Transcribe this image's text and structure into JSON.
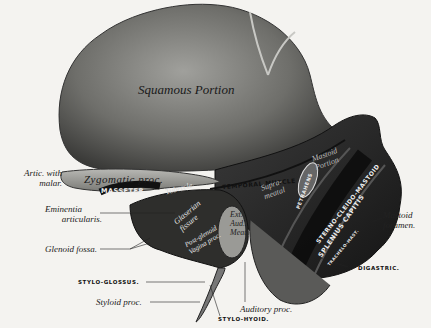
{
  "figure": {
    "regions": {
      "squamous": "Squamous Portion",
      "zygomatic": "Zygomatic proc.",
      "tubercle": "Tubercle",
      "glaserian": [
        "Glaserian",
        "fissure"
      ],
      "post_glenoid": [
        "Post-glenoid",
        "Vagina proc."
      ],
      "ext_aud_meat": [
        "Ext.",
        "Aud.",
        "Meat."
      ],
      "mastoid_portion": [
        "Mastoid",
        "Portion"
      ],
      "suprameatal": [
        "Supra-",
        "meatal"
      ],
      "temporal_muscle": "TEMPORAL MUSCLE",
      "masseter": "MASSETER.",
      "petrahens": "PETRAHENS",
      "sterno_cleido_mastoid": "STERNO-CLEIDO-MASTOID",
      "splenius_capitis": "SPLENIUS CAPITIS",
      "trachelo_mastoid": "TRACHELO-MAST."
    },
    "labels": {
      "artic_malar": [
        "Artic. with",
        "malar."
      ],
      "eminentia": [
        "Eminentia",
        "articularis."
      ],
      "glenoid": "Glenoid fossa.",
      "stylo_glossus": "STYLO-GLOSSUS.",
      "styloid": "Styloid proc.",
      "auditory": "Auditory proc.",
      "stylo_hyoid": "STYLO-HYOID.",
      "digastric": "DIGASTRIC.",
      "mastoid_foramen": [
        "Mastoid",
        "foramen."
      ]
    },
    "colors": {
      "background": "#f4f3f0",
      "bone_light": "#8a8a8a",
      "bone_dark": "#2a2a2a",
      "muscle_band": "#1a1a1a",
      "ink": "#222222"
    }
  }
}
